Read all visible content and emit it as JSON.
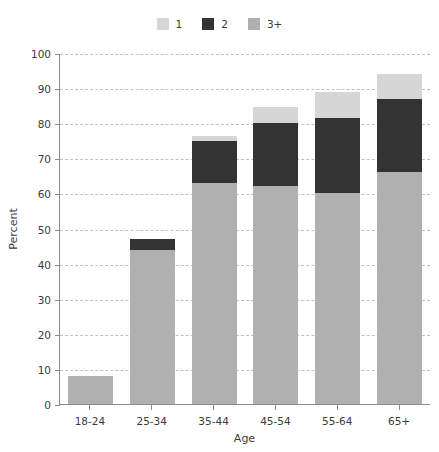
{
  "chart_data": {
    "type": "bar",
    "stacked": true,
    "title": "",
    "xlabel": "Age",
    "ylabel": "Percent",
    "ylim": [
      0,
      100
    ],
    "ytick_step": 10,
    "yticks": [
      0,
      10,
      20,
      30,
      40,
      50,
      60,
      70,
      80,
      90,
      100
    ],
    "grid": true,
    "legend_position": "top-center",
    "categories": [
      "18-24",
      "25-34",
      "35-44",
      "45-54",
      "55-64",
      "65+"
    ],
    "series": [
      {
        "name": "1",
        "color": "#d6d6d6",
        "values": [
          0,
          0,
          1.5,
          4.5,
          7.5,
          7.0
        ]
      },
      {
        "name": "2",
        "color": "#333333",
        "values": [
          0,
          3.0,
          12.0,
          18.0,
          21.5,
          21.0
        ]
      },
      {
        "name": "3+",
        "color": "#b0b0b0",
        "values": [
          8.0,
          44.0,
          63.0,
          62.0,
          60.0,
          66.0
        ]
      }
    ],
    "stack_order_bottom_to_top": [
      "3+",
      "2",
      "1"
    ],
    "totals": [
      8.0,
      47.0,
      76.5,
      84.5,
      89.0,
      94.0
    ]
  },
  "legend": {
    "entries": [
      {
        "label": "1",
        "color": "#d6d6d6"
      },
      {
        "label": "2",
        "color": "#333333"
      },
      {
        "label": "3+",
        "color": "#b0b0b0"
      }
    ]
  },
  "axes": {
    "x_title": "Age",
    "y_title": "Percent",
    "y_ticks": [
      "100",
      "90",
      "80",
      "70",
      "60",
      "50",
      "40",
      "30",
      "20",
      "10",
      "0"
    ],
    "x_ticks": [
      "18-24",
      "25-34",
      "35-44",
      "45-54",
      "55-64",
      "65+"
    ]
  },
  "colors": {
    "axis": "#8a8a8a",
    "grid": "#b9c3cf",
    "text": "#3b3b3b",
    "background": "#ffffff"
  }
}
